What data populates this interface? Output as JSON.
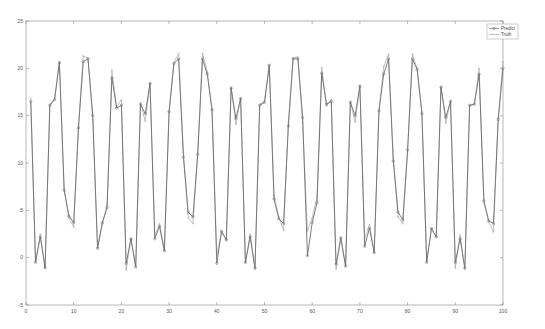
{
  "chart_data": {
    "type": "line",
    "title": "",
    "xlabel": "",
    "ylabel": "",
    "xlim": [
      0,
      100
    ],
    "ylim": [
      -5,
      25
    ],
    "xticks": [
      0,
      10,
      20,
      30,
      40,
      50,
      60,
      70,
      80,
      90,
      100
    ],
    "yticks": [
      -5,
      0,
      5,
      10,
      15,
      20,
      25
    ],
    "grid": false,
    "legend_position": "top-right",
    "x": [
      1,
      2,
      3,
      4,
      5,
      6,
      7,
      8,
      9,
      10,
      11,
      12,
      13,
      14,
      15,
      16,
      17,
      18,
      19,
      20,
      21,
      22,
      23,
      24,
      25,
      26,
      27,
      28,
      29,
      30,
      31,
      32,
      33,
      34,
      35,
      36,
      37,
      38,
      39,
      40,
      41,
      42,
      43,
      44,
      45,
      46,
      47,
      48,
      49,
      50,
      51,
      52,
      53,
      54,
      55,
      56,
      57,
      58,
      59,
      60,
      61,
      62,
      63,
      64,
      65,
      66,
      67,
      68,
      69,
      70,
      71,
      72,
      73,
      74,
      75,
      76,
      77,
      78,
      79,
      80,
      81,
      82,
      83,
      84,
      85,
      86,
      87,
      88,
      89,
      90,
      91,
      92,
      93,
      94,
      95,
      96,
      97,
      98,
      99,
      100
    ],
    "series": [
      {
        "name": "Predict",
        "color": "#6e6e6e",
        "marker": "circle",
        "values": [
          16.5,
          -0.5,
          2.2,
          -1.1,
          16.1,
          16.7,
          20.6,
          7.1,
          4.4,
          3.7,
          13.7,
          20.7,
          21.0,
          15.0,
          1.0,
          3.7,
          5.3,
          19.0,
          15.8,
          16.1,
          -0.6,
          2.0,
          -1.0,
          16.2,
          15.2,
          18.4,
          2.0,
          3.3,
          0.7,
          15.4,
          20.5,
          21.0,
          10.6,
          4.8,
          4.3,
          10.9,
          21.0,
          19.4,
          15.6,
          -0.6,
          2.8,
          1.9,
          17.9,
          14.7,
          16.8,
          -0.5,
          2.2,
          -1.1,
          16.1,
          16.4,
          20.3,
          6.2,
          4.1,
          3.6,
          13.9,
          21.0,
          21.0,
          14.8,
          0.2,
          3.7,
          5.8,
          19.5,
          16.2,
          16.5,
          -0.7,
          2.1,
          -0.9,
          16.4,
          15.0,
          18.1,
          1.2,
          3.1,
          0.5,
          15.5,
          19.4,
          21.0,
          10.2,
          4.8,
          4.0,
          11.4,
          21.0,
          19.9,
          15.2,
          -0.5,
          3.1,
          2.2,
          18.0,
          14.8,
          16.5,
          -0.5,
          2.0,
          -1.1,
          16.1,
          16.2,
          19.4,
          6.0,
          3.9,
          3.6,
          14.6,
          20.0
        ]
      },
      {
        "name": "Truth",
        "color": "#a8a8a8",
        "marker": "x",
        "values": [
          16.8,
          -0.4,
          2.5,
          -1.0,
          16.2,
          16.8,
          20.7,
          7.3,
          4.2,
          3.2,
          13.9,
          21.3,
          21.1,
          14.5,
          1.0,
          3.5,
          5.6,
          19.8,
          15.9,
          16.7,
          -1.3,
          2.0,
          -0.9,
          16.4,
          14.4,
          18.4,
          2.3,
          3.6,
          0.8,
          15.5,
          20.6,
          21.6,
          11.2,
          4.2,
          3.6,
          11.1,
          21.6,
          19.6,
          15.7,
          0.3,
          2.7,
          1.8,
          18.0,
          14.1,
          16.9,
          -0.5,
          2.5,
          -1.2,
          16.2,
          16.6,
          20.4,
          6.6,
          4.3,
          2.9,
          14.2,
          21.1,
          21.2,
          14.2,
          2.8,
          4.2,
          6.4,
          20.1,
          16.0,
          16.7,
          -1.2,
          2.1,
          -0.9,
          16.5,
          14.3,
          18.2,
          2.0,
          3.5,
          0.7,
          15.6,
          20.2,
          21.5,
          10.6,
          4.3,
          3.6,
          11.2,
          21.5,
          20.0,
          15.4,
          -0.4,
          3.0,
          2.2,
          18.1,
          14.2,
          16.6,
          -1.1,
          2.4,
          -1.2,
          16.0,
          16.3,
          20.0,
          5.8,
          3.8,
          2.7,
          14.8,
          20.7
        ]
      }
    ]
  },
  "legend": {
    "items": [
      {
        "label": "Predict"
      },
      {
        "label": "Truth"
      }
    ]
  },
  "axes": {
    "x_tick_labels": [
      "0",
      "10",
      "20",
      "30",
      "40",
      "50",
      "60",
      "70",
      "80",
      "90",
      "100"
    ],
    "y_tick_labels": [
      "-5",
      "0",
      "5",
      "10",
      "15",
      "20",
      "25"
    ]
  }
}
